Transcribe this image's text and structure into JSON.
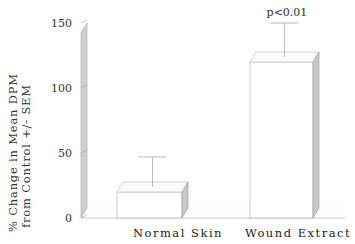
{
  "chart_data": {
    "type": "bar",
    "title": "",
    "xlabel": "",
    "ylabel_line1": "% Change in Mean DPM",
    "ylabel_line2": "from Control +/- SEM",
    "categories": [
      "Normal Skin",
      "Wound Extract"
    ],
    "values": [
      20,
      120
    ],
    "errors": [
      27,
      30
    ],
    "ylim": [
      0,
      150
    ],
    "yticks": [
      0,
      50,
      100,
      150
    ],
    "ytick_labels": [
      "0",
      "50",
      "100",
      "150"
    ],
    "annotations": [
      {
        "category": "Wound Extract",
        "text": "p<0.01"
      }
    ],
    "grid": false,
    "legend": "none",
    "style": "3d"
  }
}
